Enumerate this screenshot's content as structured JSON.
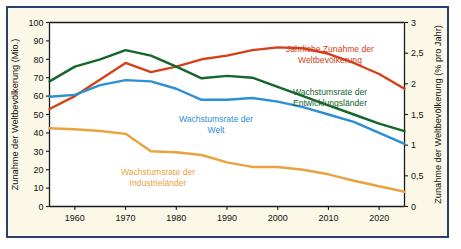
{
  "figure": {
    "background_color": "#fbf8e8",
    "frame_color": "#2b3f6b",
    "page_color": "#ffffff"
  },
  "chart_data": {
    "type": "line",
    "title": "",
    "xlabel": "",
    "ylabel": "Zunahme der Weltbevölkerung (Mio.)",
    "y2label": "Zunahme der Weltbevölkerung (% pro Jahr)",
    "xlim": [
      1955,
      2025
    ],
    "ylim": [
      0,
      100
    ],
    "y2lim": [
      0,
      3
    ],
    "grid": false,
    "legend_position": "inline-annotations",
    "xticks": [
      1960,
      1970,
      1980,
      1990,
      2000,
      2010,
      2020
    ],
    "xtick_labels": [
      "1960",
      "1970",
      "1980",
      "1990",
      "2000",
      "2010",
      "2020"
    ],
    "yticks": [
      0,
      10,
      20,
      30,
      40,
      50,
      60,
      70,
      80,
      90,
      100
    ],
    "ytick_labels": [
      "0",
      "10",
      "20",
      "30",
      "40",
      "50",
      "60",
      "70",
      "80",
      "90",
      "100"
    ],
    "y2ticks": [
      0,
      0.5,
      1,
      1.5,
      2,
      2.5,
      3
    ],
    "y2tick_labels": [
      "0",
      "0,5",
      "1",
      "1,5",
      "2",
      "2,5",
      "3"
    ],
    "x": [
      1955,
      1960,
      1965,
      1970,
      1975,
      1980,
      1985,
      1990,
      1995,
      2000,
      2005,
      2010,
      2015,
      2020,
      2025
    ],
    "series": [
      {
        "name": "Jährliche Zunahme der Weltbevölkerung",
        "color": "#d4401a",
        "axis": "left",
        "unit": "Mio.",
        "values": [
          53,
          60,
          69,
          78,
          73,
          76,
          80,
          82,
          85,
          86.5,
          86,
          83,
          78,
          72,
          64
        ]
      },
      {
        "name": "Wachstumsrate der Entwicklungsländer",
        "color": "#14662b",
        "axis": "right",
        "unit": "% pro Jahr",
        "values": [
          2.04,
          2.28,
          2.4,
          2.55,
          2.46,
          2.28,
          2.09,
          2.13,
          2.1,
          1.95,
          1.8,
          1.65,
          1.5,
          1.35,
          1.23
        ]
      },
      {
        "name": "Wachstumsrate der Welt",
        "color": "#2b8fd4",
        "axis": "right",
        "unit": "% pro Jahr",
        "values": [
          1.79,
          1.82,
          1.98,
          2.06,
          2.04,
          1.92,
          1.74,
          1.74,
          1.77,
          1.71,
          1.62,
          1.5,
          1.38,
          1.2,
          1.02
        ]
      },
      {
        "name": "Wachstumsrate der Industrieländer",
        "color": "#e8a33d",
        "axis": "left",
        "unit": "Mio.",
        "values": [
          42.5,
          42,
          41,
          39.5,
          30,
          29.5,
          28,
          24,
          21.5,
          21.5,
          20,
          17.5,
          14,
          11,
          8
        ]
      }
    ],
    "annotations": [
      {
        "id": "label-weltbevoelkerung",
        "lines": [
          "Jährliche Zunahme der",
          "Weltbevölkerung"
        ],
        "color": "#d4401a"
      },
      {
        "id": "label-entwicklungslaender",
        "lines": [
          "Wachstumsrate der",
          "Entwicklungsländer"
        ],
        "color": "#14662b"
      },
      {
        "id": "label-welt",
        "lines": [
          "Wachstumsrate der",
          "Welt"
        ],
        "color": "#2b8fd4"
      },
      {
        "id": "label-industrielaender",
        "lines": [
          "Wachstumsrate der",
          "Industrieländer"
        ],
        "color": "#e8a33d"
      }
    ]
  }
}
